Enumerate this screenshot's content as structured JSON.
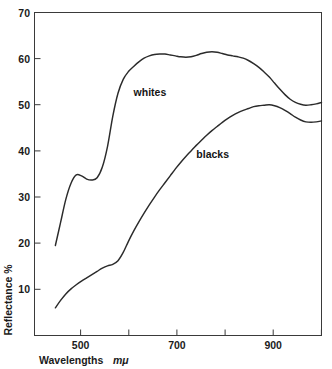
{
  "chart_data": {
    "type": "line",
    "title": "",
    "subtitle": "",
    "xlabel": "Wavelengths",
    "xlabel_unit": "mμ",
    "ylabel": "Reflectance %",
    "xlim": [
      450,
      1000
    ],
    "ylim": [
      0,
      70
    ],
    "grid": false,
    "legend_position": "inline-annotation",
    "x_ticks": [
      500,
      600,
      700,
      800,
      900,
      1000
    ],
    "x_tick_labels": [
      "500",
      "",
      "700",
      "",
      "900",
      ""
    ],
    "y_ticks": [
      10,
      20,
      30,
      40,
      50,
      60,
      70
    ],
    "y_tick_labels": [
      "10",
      "20",
      "30",
      "40",
      "50",
      "60",
      "70"
    ],
    "annotations": [
      {
        "text": "whites",
        "x": 640,
        "y": 52
      },
      {
        "text": "blacks",
        "x": 760,
        "y": 38.5
      }
    ],
    "series": [
      {
        "name": "whites",
        "x": [
          490,
          500,
          510,
          520,
          530,
          540,
          550,
          560,
          570,
          580,
          590,
          600,
          610,
          620,
          630,
          640,
          650,
          660,
          670,
          680,
          690,
          700,
          710,
          720,
          730,
          740,
          750,
          760,
          770,
          780,
          790,
          800,
          810,
          820,
          830,
          840,
          850,
          860,
          870,
          880,
          890,
          900,
          910,
          920,
          930,
          940,
          950,
          960,
          970,
          980,
          990,
          1000
        ],
        "y": [
          19.5,
          24.5,
          29.5,
          33.0,
          34.8,
          34.6,
          33.9,
          33.7,
          34.2,
          36.5,
          41.0,
          47.5,
          52.5,
          55.5,
          57.2,
          58.3,
          59.3,
          60.1,
          60.6,
          60.9,
          61.0,
          61.0,
          60.8,
          60.6,
          60.4,
          60.3,
          60.4,
          60.7,
          61.1,
          61.4,
          61.5,
          61.4,
          61.1,
          60.8,
          60.6,
          60.4,
          60.1,
          59.6,
          58.9,
          58.1,
          57.1,
          56.0,
          54.7,
          53.4,
          52.2,
          51.2,
          50.5,
          50.1,
          49.9,
          50.0,
          50.2,
          50.5
        ]
      },
      {
        "name": "blacks",
        "x": [
          490,
          500,
          510,
          520,
          530,
          540,
          550,
          560,
          570,
          580,
          590,
          600,
          610,
          620,
          630,
          640,
          650,
          660,
          670,
          680,
          690,
          700,
          710,
          720,
          730,
          740,
          750,
          760,
          770,
          780,
          790,
          800,
          810,
          820,
          830,
          840,
          850,
          860,
          870,
          880,
          890,
          900,
          910,
          920,
          930,
          940,
          950,
          960,
          970,
          980,
          990,
          1000
        ],
        "y": [
          6.0,
          7.6,
          9.0,
          10.1,
          11.0,
          11.8,
          12.5,
          13.2,
          13.9,
          14.6,
          15.1,
          15.4,
          16.2,
          18.0,
          20.4,
          22.6,
          24.6,
          26.5,
          28.3,
          30.0,
          31.6,
          33.1,
          34.6,
          36.1,
          37.5,
          38.8,
          40.0,
          41.2,
          42.3,
          43.4,
          44.4,
          45.3,
          46.2,
          47.0,
          47.7,
          48.3,
          48.8,
          49.2,
          49.6,
          49.8,
          49.9,
          50.0,
          49.8,
          49.4,
          48.8,
          48.1,
          47.3,
          46.7,
          46.3,
          46.2,
          46.3,
          46.5
        ]
      }
    ]
  },
  "axes": {
    "y_axis_title": "Reflectance %",
    "x_axis_title_main": "Wavelengths",
    "x_axis_title_unit": "mμ"
  },
  "colors": {
    "curve": "#2b2b2b",
    "frame": "#3a3a3a",
    "text": "#1b1b1b",
    "background": "#ffffff"
  }
}
